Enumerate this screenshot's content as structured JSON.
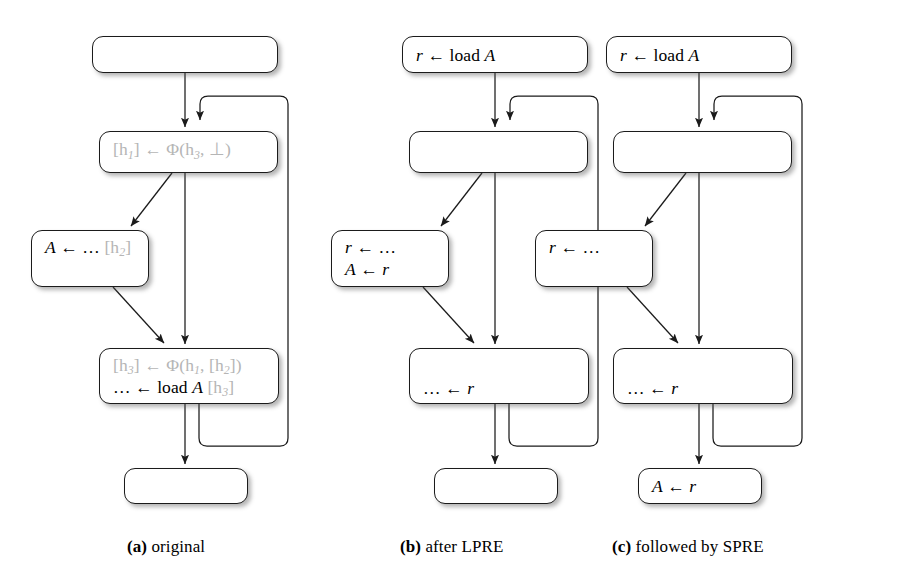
{
  "figure": {
    "panels": [
      {
        "id": "a",
        "caption_label": "(a)",
        "caption_text": "original",
        "nodes": [
          {
            "name": "entry-block",
            "lines": []
          },
          {
            "name": "loop-header-block",
            "lines": [
              {
                "segments": [
                  {
                    "text": "[h",
                    "style": "gray-upright"
                  },
                  {
                    "text": "1",
                    "style": "gray-sub"
                  },
                  {
                    "text": "] ← Φ(h",
                    "style": "gray-upright"
                  },
                  {
                    "text": "3",
                    "style": "gray-sub"
                  },
                  {
                    "text": ", ⊥)",
                    "style": "gray-upright"
                  }
                ]
              }
            ]
          },
          {
            "name": "store-block",
            "lines": [
              {
                "segments": [
                  {
                    "text": "A",
                    "style": "italic"
                  },
                  {
                    "text": " ← … ",
                    "style": "upright"
                  },
                  {
                    "text": "[h",
                    "style": "gray-upright"
                  },
                  {
                    "text": "2",
                    "style": "gray-sub"
                  },
                  {
                    "text": "]",
                    "style": "gray-upright"
                  }
                ]
              }
            ]
          },
          {
            "name": "load-merge-block",
            "lines": [
              {
                "segments": [
                  {
                    "text": "[h",
                    "style": "gray-upright"
                  },
                  {
                    "text": "3",
                    "style": "gray-sub"
                  },
                  {
                    "text": "] ← Φ(h",
                    "style": "gray-upright"
                  },
                  {
                    "text": "1",
                    "style": "gray-sub"
                  },
                  {
                    "text": ", [h",
                    "style": "gray-upright"
                  },
                  {
                    "text": "2",
                    "style": "gray-sub"
                  },
                  {
                    "text": "])",
                    "style": "gray-upright"
                  }
                ]
              },
              {
                "segments": [
                  {
                    "text": "… ← load ",
                    "style": "upright"
                  },
                  {
                    "text": "A",
                    "style": "italic"
                  },
                  {
                    "text": " [h",
                    "style": "gray-upright"
                  },
                  {
                    "text": "3",
                    "style": "gray-sub"
                  },
                  {
                    "text": "]",
                    "style": "gray-upright"
                  }
                ]
              }
            ]
          },
          {
            "name": "exit-block",
            "lines": []
          }
        ]
      },
      {
        "id": "b",
        "caption_label": "(b)",
        "caption_text": "after LPRE",
        "nodes": [
          {
            "name": "entry-block",
            "lines": [
              {
                "segments": [
                  {
                    "text": "r",
                    "style": "italic"
                  },
                  {
                    "text": " ← load ",
                    "style": "upright"
                  },
                  {
                    "text": "A",
                    "style": "italic"
                  }
                ]
              }
            ]
          },
          {
            "name": "loop-header-block",
            "lines": []
          },
          {
            "name": "store-block",
            "lines": [
              {
                "segments": [
                  {
                    "text": "r",
                    "style": "italic"
                  },
                  {
                    "text": " ← …",
                    "style": "upright"
                  }
                ]
              },
              {
                "segments": [
                  {
                    "text": "A",
                    "style": "italic"
                  },
                  {
                    "text": " ← ",
                    "style": "upright"
                  },
                  {
                    "text": "r",
                    "style": "italic"
                  }
                ]
              }
            ]
          },
          {
            "name": "load-merge-block",
            "lines": [
              {
                "segments": []
              },
              {
                "segments": [
                  {
                    "text": "… ← ",
                    "style": "upright"
                  },
                  {
                    "text": "r",
                    "style": "italic"
                  }
                ]
              }
            ]
          },
          {
            "name": "exit-block",
            "lines": []
          }
        ]
      },
      {
        "id": "c",
        "caption_label": "(c)",
        "caption_text": "followed by SPRE",
        "nodes": [
          {
            "name": "entry-block",
            "lines": [
              {
                "segments": [
                  {
                    "text": "r",
                    "style": "italic"
                  },
                  {
                    "text": " ← load ",
                    "style": "upright"
                  },
                  {
                    "text": "A",
                    "style": "italic"
                  }
                ]
              }
            ]
          },
          {
            "name": "loop-header-block",
            "lines": []
          },
          {
            "name": "store-block",
            "lines": [
              {
                "segments": [
                  {
                    "text": "r",
                    "style": "italic"
                  },
                  {
                    "text": " ← …",
                    "style": "upright"
                  }
                ]
              }
            ]
          },
          {
            "name": "load-merge-block",
            "lines": [
              {
                "segments": []
              },
              {
                "segments": [
                  {
                    "text": "… ← ",
                    "style": "upright"
                  },
                  {
                    "text": "r",
                    "style": "italic"
                  }
                ]
              }
            ]
          },
          {
            "name": "exit-block",
            "lines": [
              {
                "segments": [
                  {
                    "text": "A",
                    "style": "italic"
                  },
                  {
                    "text": " ← ",
                    "style": "upright"
                  },
                  {
                    "text": "r",
                    "style": "italic"
                  }
                ]
              }
            ]
          }
        ]
      }
    ],
    "colors": {
      "edge": "#1b1b1b",
      "node_border": "#1b1b1b",
      "node_fill": "#ffffff",
      "faded_text": "#b5b5b5",
      "text": "#000000",
      "background": "#ffffff"
    }
  }
}
